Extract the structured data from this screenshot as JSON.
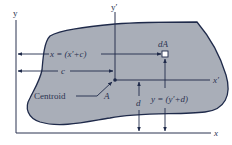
{
  "diagram": {
    "colors": {
      "region_fill": "#a9aeb8",
      "outline": "#1f2a4a",
      "axis": "#2b3350",
      "background": "#ffffff"
    },
    "axes": {
      "y": "y",
      "x": "x",
      "y_prime": "y′",
      "x_prime": "x′"
    },
    "labels": {
      "dA": "dA",
      "x_eq": "x = (x′+c)",
      "c": "c",
      "centroid": "Centroid",
      "A": "A",
      "d": "d",
      "y_eq": "y = (y′+d)"
    }
  }
}
